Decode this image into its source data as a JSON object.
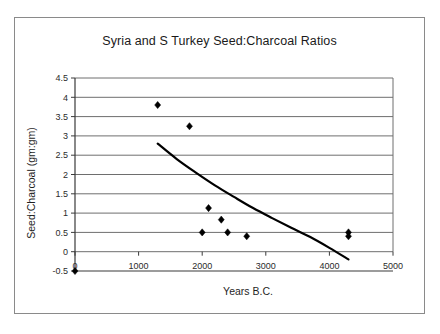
{
  "chart_data": {
    "type": "scatter",
    "title": "Syria and S Turkey Seed:Charcoal Ratios",
    "xlabel": "Years B.C.",
    "ylabel": "Seed:Charcoal (gm:gm)",
    "xlim": [
      0,
      5000
    ],
    "ylim": [
      -0.5,
      4.5
    ],
    "xticks": [
      0,
      1000,
      2000,
      3000,
      4000,
      5000
    ],
    "xtick_labels": [
      "0",
      "1000",
      "2000",
      "3000",
      "4000",
      "5000"
    ],
    "yticks": [
      -0.5,
      0,
      0.5,
      1,
      1.5,
      2,
      2.5,
      3,
      3.5,
      4,
      4.5
    ],
    "ytick_labels": [
      "-0.5",
      "0",
      "0.5",
      "1",
      "1.5",
      "2",
      "2.5",
      "3",
      "3.5",
      "4",
      "4.5"
    ],
    "grid": "horizontal",
    "gridline_values": [
      0,
      0.5,
      1,
      1.5,
      2,
      2.5,
      3,
      3.5,
      4,
      4.5
    ],
    "legend": "none",
    "marker": "diamond",
    "marker_color": "#000000",
    "series": [
      {
        "name": "Seed:Charcoal ratio",
        "points": [
          {
            "x": 0,
            "y": -0.5
          },
          {
            "x": 1300,
            "y": 3.8
          },
          {
            "x": 1800,
            "y": 3.25
          },
          {
            "x": 2000,
            "y": 0.5
          },
          {
            "x": 2100,
            "y": 1.13
          },
          {
            "x": 2300,
            "y": 0.83
          },
          {
            "x": 2400,
            "y": 0.5
          },
          {
            "x": 2700,
            "y": 0.4
          },
          {
            "x": 4300,
            "y": 0.5
          },
          {
            "x": 4300,
            "y": 0.4
          }
        ]
      }
    ],
    "trendline": {
      "name": "fitted trend",
      "color": "#000000",
      "points": [
        {
          "x": 1300,
          "y": 2.8
        },
        {
          "x": 1600,
          "y": 2.4
        },
        {
          "x": 1900,
          "y": 2.05
        },
        {
          "x": 2200,
          "y": 1.72
        },
        {
          "x": 2500,
          "y": 1.42
        },
        {
          "x": 2800,
          "y": 1.13
        },
        {
          "x": 3100,
          "y": 0.87
        },
        {
          "x": 3400,
          "y": 0.62
        },
        {
          "x": 3700,
          "y": 0.38
        },
        {
          "x": 4000,
          "y": 0.1
        },
        {
          "x": 4300,
          "y": -0.2
        }
      ]
    }
  }
}
